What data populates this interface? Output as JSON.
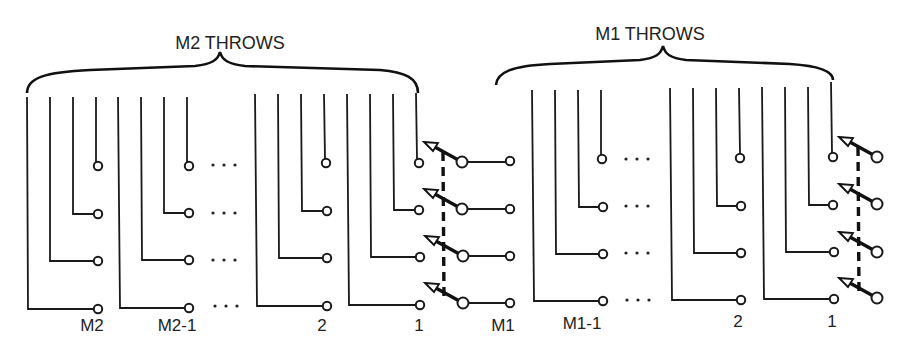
{
  "diagram": {
    "type": "multi-pole multi-throw switch schematic",
    "sections": [
      {
        "id": "m2",
        "title": "M2 THROWS",
        "groups": [
          {
            "label": "M2",
            "terminal_x": 98,
            "vertical_x": [
              27,
              50,
              73,
              96
            ]
          },
          {
            "label": "M2-1",
            "terminal_x": 189,
            "vertical_x": [
              118,
              141,
              164,
              187
            ]
          },
          {
            "label": "2",
            "terminal_x": 327,
            "vertical_x": [
              255,
              278,
              301,
              324
            ]
          },
          {
            "label": "1",
            "terminal_x": 419,
            "vertical_x": [
              347,
              370,
              393,
              416
            ]
          }
        ],
        "ellipsis": "· · ·",
        "rows_y": [
          166,
          214,
          261,
          309
        ],
        "switch": {
          "pivot_x": 462,
          "gang_x": 443,
          "output_terminal_x": 510,
          "output_label": "M1"
        }
      },
      {
        "id": "m1",
        "title": "M1 THROWS",
        "groups": [
          {
            "label": "M1-1",
            "terminal_x": 603,
            "vertical_x": [
              532,
              555,
              578,
              601
            ]
          },
          {
            "label": "2",
            "terminal_x": 741,
            "vertical_x": [
              670,
              693,
              716,
              739
            ]
          },
          {
            "label": "1",
            "terminal_x": 833,
            "vertical_x": [
              762,
              785,
              808,
              831
            ]
          }
        ],
        "ellipsis": "· · ·",
        "rows_y": [
          158,
          205,
          253,
          300
        ],
        "switch": {
          "pivot_x": 877,
          "gang_x": 858
        }
      }
    ],
    "labels": {
      "m2_title": "M2 THROWS",
      "m1_title": "M1 THROWS",
      "m2": "M2",
      "m2_minus_1": "M2-1",
      "m2_group_2": "2",
      "m2_group_1": "1",
      "m1": "M1",
      "m1_minus_1": "M1-1",
      "m1_group_2": "2",
      "m1_group_1": "1"
    },
    "poles": 4
  }
}
